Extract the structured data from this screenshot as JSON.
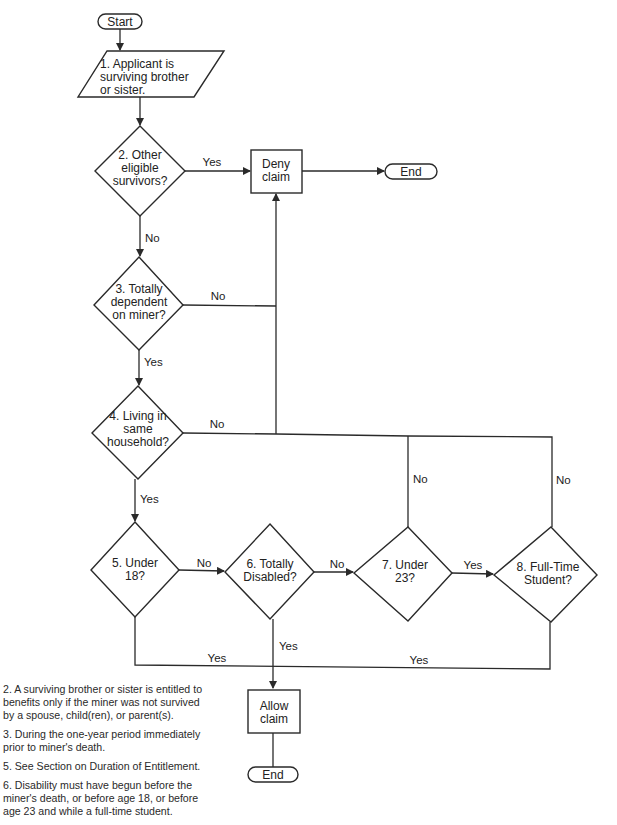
{
  "flowchart": {
    "nodes": {
      "start": "Start",
      "n1": [
        "1. Applicant is",
        "surviving brother",
        "or sister."
      ],
      "n2": [
        "2. Other",
        "eligible",
        "survivors?"
      ],
      "deny": [
        "Deny",
        "claim"
      ],
      "end_top": "End",
      "n3": [
        "3. Totally",
        "dependent",
        "on miner?"
      ],
      "n4": [
        "4. Living in",
        "same",
        "household?"
      ],
      "n5": [
        "5. Under",
        "18?"
      ],
      "n6": [
        "6. Totally",
        "Disabled?"
      ],
      "n7": [
        "7. Under",
        "23?"
      ],
      "n8": [
        "8. Full-Time",
        "Student?"
      ],
      "allow": [
        "Allow",
        "claim"
      ],
      "end_bottom": "End"
    },
    "edge_labels": {
      "n2_yes": "Yes",
      "n2_no": "No",
      "n3_no": "No",
      "n3_yes": "Yes",
      "n4_no": "No",
      "n4_yes": "Yes",
      "n5_no": "No",
      "n6_no": "No",
      "n7_yes": "Yes",
      "n7_no": "No",
      "n8_no": "No",
      "n5_yes": "Yes",
      "n8_yes": "Yes",
      "n6_yes": "Yes"
    }
  },
  "notes": [
    "2. A surviving brother or sister is entitled to benefits only if the miner was not survived by a spouse, child(ren), or parent(s).",
    "3. During the one-year period immediately prior to miner's death.",
    "5. See Section on Duration of Entitlement.",
    "6. Disability must have begun before the miner's death, or before age 18, or before age 23 and while a full-time student."
  ]
}
